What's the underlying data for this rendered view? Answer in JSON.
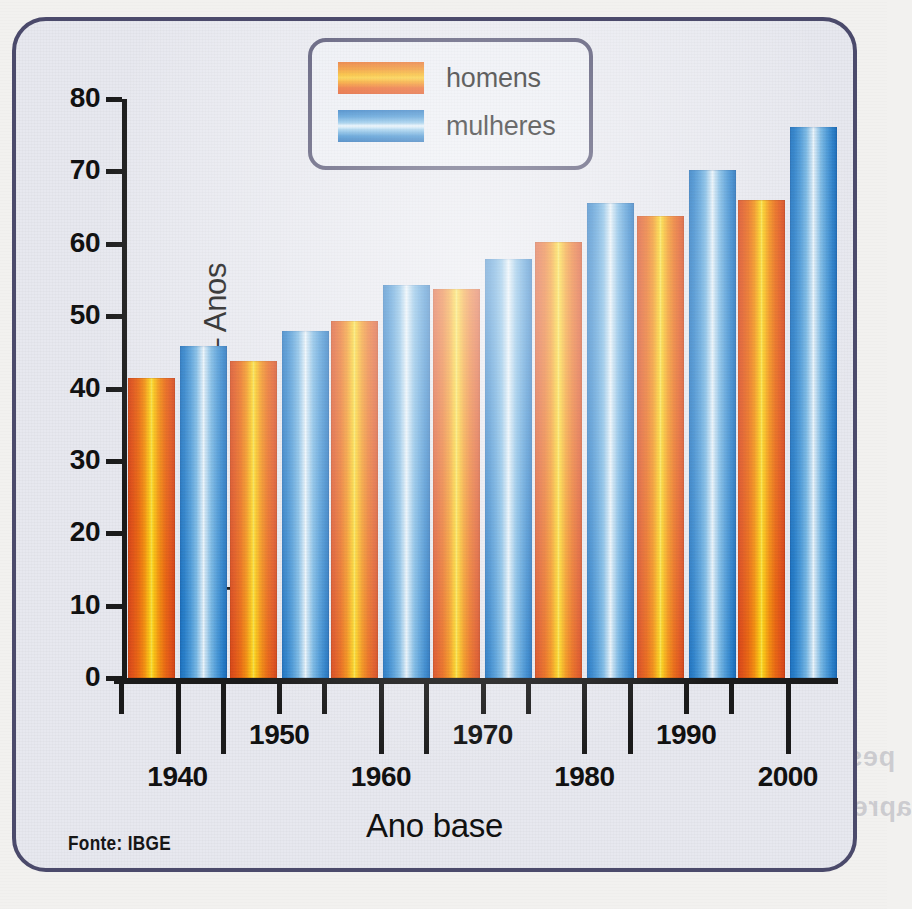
{
  "figure": {
    "source_note": "Fonte: IBGE",
    "frame_color": "#4b4a6b",
    "background_color": "#e7e8ef"
  },
  "legend": {
    "position": "top-center",
    "entries": [
      {
        "label": "homens",
        "color": "#ea5a18",
        "swatch": "homens-swatch"
      },
      {
        "label": "mulheres",
        "color": "#2a80cb",
        "swatch": "mulheres-swatch"
      }
    ]
  },
  "bleed_text": {
    "line1": "pessoas permanece jovem na medida em qu",
    "line2": "aprender, adquirir novos hábitos, e tolerar contra",
    "line3": "faint show-through"
  },
  "chart_data": {
    "type": "bar",
    "title": "",
    "xlabel": "Ano base",
    "ylabel": "Expectativa de vida – Anos",
    "categories": [
      "1940",
      "1950",
      "1960",
      "1970",
      "1980",
      "1990",
      "2000"
    ],
    "ylim": [
      0,
      80
    ],
    "yticks": [
      0,
      10,
      20,
      30,
      40,
      50,
      60,
      70,
      80
    ],
    "ytick_labels": [
      "0",
      "10",
      "20",
      "30",
      "40",
      "50",
      "60",
      "70",
      "80"
    ],
    "grid": false,
    "legend_position": "top-center",
    "series": [
      {
        "name": "homens",
        "color": "#ea5a18",
        "values": [
          41.5,
          43.8,
          49.3,
          53.8,
          60.2,
          63.9,
          66.0
        ]
      },
      {
        "name": "mulheres",
        "color": "#2a80cb",
        "values": [
          45.9,
          48.0,
          54.3,
          57.9,
          65.6,
          70.2,
          76.2
        ]
      }
    ]
  }
}
